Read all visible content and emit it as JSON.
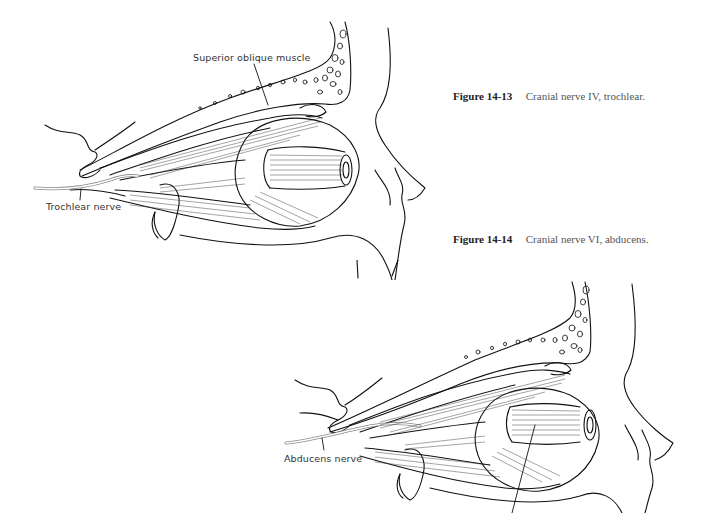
{
  "figures": [
    {
      "number": "Figure 14-13",
      "caption": "Cranial nerve IV, trochlear.",
      "labels": {
        "muscle": "Superior oblique muscle",
        "nerve": "Trochlear nerve"
      }
    },
    {
      "number": "Figure 14-14",
      "caption": "Cranial nerve VI, abducens.",
      "labels": {
        "nerve": "Abducens nerve"
      }
    }
  ]
}
